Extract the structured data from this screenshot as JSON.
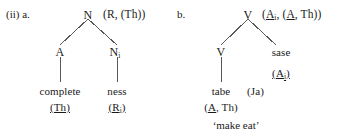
{
  "figure": {
    "example_number": "(ii)",
    "branch_colors": "#555a5e",
    "text_color": "#1a1a1a",
    "background": "#ffffff"
  },
  "tree_a": {
    "item_label": "a.",
    "root": {
      "category": "N",
      "argument_structure": "(R, (Th))"
    },
    "left_child": {
      "category": "A",
      "leaf_word": "complete",
      "leaf_features": "(Th)"
    },
    "right_child": {
      "category": "N",
      "category_subscript": "i",
      "leaf_word": "ness",
      "leaf_features_open": "(R",
      "leaf_features_subscript": "i",
      "leaf_features_close": ")"
    }
  },
  "tree_b": {
    "item_label": "b.",
    "root": {
      "category": "V",
      "args_open": "(",
      "args_a1": "A",
      "args_a1_sub": "i",
      "args_mid": ", (",
      "args_a2": "A",
      "args_a2_rest": ", Th",
      "args_close": "))"
    },
    "left_child": {
      "category": "V",
      "leaf_word": "tabe",
      "leaf_language": "(Ja)",
      "leaf_features_open": "(",
      "leaf_features_a": "A",
      "leaf_features_rest": ", Th)"
    },
    "right_child": {
      "category": "sase",
      "features_open": "(",
      "features_a": "A",
      "features_sub": "i",
      "features_close": ")"
    },
    "gloss": "‘make eat’"
  }
}
